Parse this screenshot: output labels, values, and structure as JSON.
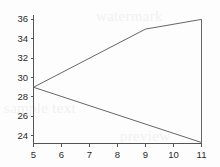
{
  "chart_data": {
    "type": "line",
    "title": "",
    "subtitle": "",
    "xlabel": "",
    "ylabel": "",
    "xlim": [
      5,
      11
    ],
    "ylim": [
      23.2,
      36.4
    ],
    "xticks": [
      5,
      6,
      7,
      8,
      9,
      10,
      11
    ],
    "yticks": [
      24,
      26,
      28,
      30,
      32,
      34,
      36
    ],
    "xtick_labels": [
      "5",
      "6",
      "7",
      "8",
      "9",
      "10",
      "11"
    ],
    "ytick_labels": [
      "24",
      "26",
      "28",
      "30",
      "32",
      "34",
      "36"
    ],
    "grid": false,
    "legend": "none",
    "series": [
      {
        "name": "upper-bound",
        "x": [
          5,
          9,
          11
        ],
        "values": [
          29,
          35,
          36
        ]
      },
      {
        "name": "lower-bound",
        "x": [
          5,
          11
        ],
        "values": [
          29,
          23.3
        ]
      },
      {
        "name": "right-closure",
        "x": [
          11,
          11
        ],
        "values": [
          36,
          23.3
        ]
      }
    ],
    "annotations": [],
    "colors": {
      "line": "#555555",
      "axis": "#555555",
      "tick_text": "#2a2a2a",
      "background": "#fdfdfd",
      "watermark": "#f2f1ef"
    }
  },
  "watermark": {
    "line_a": "sample text",
    "line_b": "watermark",
    "line_c": "preview"
  }
}
